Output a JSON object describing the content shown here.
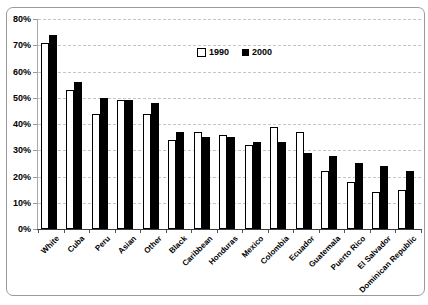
{
  "chart": {
    "legend": {
      "items": [
        {
          "label": "1990",
          "swatch": "white-square"
        },
        {
          "label": "2000",
          "swatch": "black-square"
        }
      ]
    },
    "colors": {
      "bar_1990_fill": "#ffffff",
      "bar_1990_border": "#000000",
      "bar_2000_fill": "#000000",
      "gridline": "#c6c6c6",
      "axis": "#3c3c3c",
      "frame_border": "#9a9a9a",
      "text": "#000000"
    }
  },
  "chart_data": {
    "type": "bar",
    "title": "",
    "xlabel": "",
    "ylabel": "",
    "categories": [
      "White",
      "Cuba",
      "Peru",
      "Asian",
      "Other",
      "Black",
      "Caribbean",
      "Honduras",
      "Mexico",
      "Colombia",
      "Ecuador",
      "Guatemala",
      "Puerto Rico",
      "El Salvador",
      "Dominican Republic"
    ],
    "series": [
      {
        "name": "1990",
        "values": [
          71,
          53,
          44,
          49,
          44,
          34,
          37,
          36,
          32,
          39,
          37,
          22,
          18,
          14,
          15
        ]
      },
      {
        "name": "2000",
        "values": [
          74,
          56,
          50,
          49,
          48,
          37,
          35,
          35,
          33,
          33,
          29,
          28,
          25,
          24,
          22
        ]
      }
    ],
    "ylim": [
      0,
      80
    ],
    "y_ticks": [
      "0%",
      "10%",
      "20%",
      "30%",
      "40%",
      "50%",
      "60%",
      "70%",
      "80%"
    ],
    "grid": "horizontal-dashed",
    "legend_position": "inside-top-center",
    "x_label_rotation_deg": 45
  }
}
